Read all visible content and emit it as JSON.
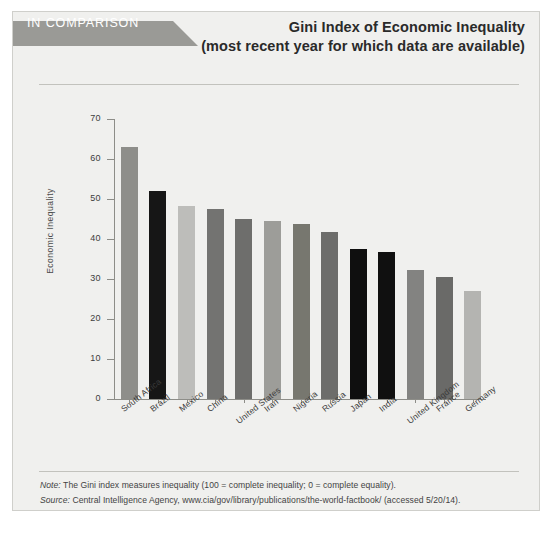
{
  "header": {
    "ribbon_label": "IN COMPARISON",
    "title_main": "Gini Index of Economic Inequality",
    "title_sub": "(most recent year for which data are available)"
  },
  "footer": {
    "note_lead": "Note:",
    "note_text": " The Gini index measures inequality (100 = complete inequality; 0 = complete equality).",
    "source_lead": "Source:",
    "source_text": " Central Intelligence Agency, www.cia/gov/library/publications/the-world-factbook/ (accessed 5/20/14)."
  },
  "chart_data": {
    "type": "bar",
    "title": "Gini Index of Economic Inequality",
    "subtitle": "(most recent year for which data are available)",
    "xlabel": "",
    "ylabel": "Economic Inequality",
    "ylim": [
      0,
      70
    ],
    "yticks": [
      0,
      10,
      20,
      30,
      40,
      50,
      60,
      70
    ],
    "grid": false,
    "legend": null,
    "categories": [
      "South Africa",
      "Brazil",
      "Mexico",
      "China",
      "United States",
      "Iran",
      "Nigeria",
      "Russia",
      "Japan",
      "India",
      "United Kingdom",
      "France",
      "Germany"
    ],
    "values": [
      63.1,
      51.9,
      48.3,
      47.4,
      45.0,
      44.5,
      43.7,
      41.7,
      37.6,
      36.8,
      32.3,
      30.6,
      27.0
    ],
    "bar_colors": [
      "#8e8e8a",
      "#161616",
      "#bdbdba",
      "#737371",
      "#6e6e6c",
      "#9d9d99",
      "#77776f",
      "#6d6d6b",
      "#0f0f0f",
      "#101010",
      "#838381",
      "#6a6a68",
      "#b4b4b1"
    ],
    "colors": {
      "panel_background": "#f0f0ee",
      "panel_border": "#cfcfcb",
      "ribbon": "#9a9a96",
      "axis": "#8d8d88",
      "text": "#3b3b3b"
    }
  }
}
